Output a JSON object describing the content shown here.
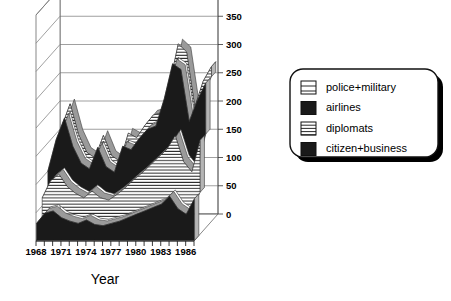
{
  "chart_data": {
    "type": "area",
    "title": "",
    "subtitle": "",
    "xlabel": "Year",
    "ylabel": "",
    "projection": "3d-stacked-ribbon",
    "grid": true,
    "legend_position": "right",
    "xlim": [
      1968,
      1987
    ],
    "ylim": [
      0,
      400
    ],
    "yticks": [
      0,
      50,
      100,
      150,
      200,
      250,
      300,
      350,
      400
    ],
    "ytick_labels": [
      "0",
      "50",
      "100",
      "150",
      "200",
      "250",
      "300",
      "350",
      "400"
    ],
    "xticks": [
      1968,
      1969,
      1970,
      1971,
      1972,
      1973,
      1974,
      1975,
      1976,
      1977,
      1978,
      1979,
      1980,
      1981,
      1982,
      1983,
      1984,
      1985,
      1986,
      1987
    ],
    "xtick_labels": [
      "1968",
      "",
      "",
      "1971",
      "",
      "",
      "1974",
      "",
      "",
      "1977",
      "",
      "",
      "1980",
      "",
      "",
      "1983",
      "",
      "",
      "1986",
      ""
    ],
    "x": [
      1968,
      1969,
      1970,
      1971,
      1972,
      1973,
      1974,
      1975,
      1976,
      1977,
      1978,
      1979,
      1980,
      1981,
      1982,
      1983,
      1984,
      1985,
      1986,
      1987
    ],
    "stacked": true,
    "series": [
      {
        "name": "citizen+business",
        "pattern": "solid-black",
        "color": "#1a1a1a",
        "values": [
          30,
          48,
          52,
          40,
          34,
          30,
          36,
          28,
          26,
          30,
          34,
          40,
          46,
          52,
          58,
          64,
          78,
          56,
          46,
          74
        ]
      },
      {
        "name": "diplomats",
        "pattern": "horizontal-stripes",
        "color": "#ffffff",
        "values": [
          34,
          46,
          54,
          44,
          38,
          34,
          40,
          36,
          34,
          40,
          48,
          56,
          62,
          70,
          78,
          86,
          96,
          72,
          64,
          92
        ]
      },
      {
        "name": "airlines",
        "pattern": "solid-black",
        "color": "#1a1a1a",
        "values": [
          36,
          62,
          88,
          60,
          42,
          40,
          66,
          44,
          38,
          74,
          56,
          62,
          66,
          58,
          92,
          140,
          106,
          60,
          116,
          90
        ]
      },
      {
        "name": "police+military",
        "pattern": "sparse-horizontal-lines",
        "color": "#ffffff",
        "values": [
          8,
          12,
          14,
          10,
          8,
          8,
          10,
          8,
          8,
          12,
          10,
          12,
          14,
          12,
          16,
          24,
          20,
          14,
          22,
          18
        ]
      }
    ],
    "totals": [
      108,
      168,
      208,
      154,
      122,
      112,
      152,
      116,
      106,
      156,
      148,
      170,
      188,
      192,
      244,
      314,
      300,
      202,
      248,
      274
    ]
  },
  "legend": {
    "items": [
      {
        "label": "police+military",
        "swatch": "sparse-lines-swatch"
      },
      {
        "label": "airlines",
        "swatch": "solid-black-swatch"
      },
      {
        "label": "diplomats",
        "swatch": "dense-lines-swatch"
      },
      {
        "label": "citizen+business",
        "swatch": "solid-black-swatch"
      }
    ]
  },
  "axis": {
    "x_title": "Year"
  },
  "colors": {
    "ribbon_dark": "#1a1a1a",
    "ribbon_top_face": "#9a9a9a",
    "ribbon_side_face": "#b5b5b5",
    "frame_line": "#555555",
    "grid_line": "#777777",
    "legend_shadow": "#000000",
    "background": "#ffffff"
  }
}
